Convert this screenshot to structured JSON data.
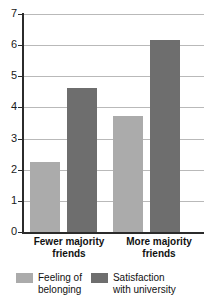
{
  "chart_data": {
    "type": "bar",
    "title": "",
    "subtitle": "",
    "xlabel": "",
    "ylabel": "",
    "ylim": [
      0,
      7
    ],
    "yticks": [
      0,
      1,
      2,
      3,
      4,
      5,
      6,
      7
    ],
    "ytick_labels": [
      "0",
      "1",
      "2",
      "3",
      "4",
      "5",
      "6",
      "7"
    ],
    "grid": true,
    "legend_position": "bottom",
    "categories": [
      "Fewer majority\nfriends",
      "More majority\nfriends"
    ],
    "category_labels_flat": [
      "Fewer majority friends",
      "More majority friends"
    ],
    "series": [
      {
        "name": "Feeling of\nbelonging",
        "name_flat": "Feeling of belonging",
        "color": "#ababab",
        "values": [
          2.25,
          3.73
        ]
      },
      {
        "name": "Satisfaction\nwith university",
        "name_flat": "Satisfaction with university",
        "color": "#6e6e6e",
        "values": [
          4.62,
          6.18
        ]
      }
    ]
  },
  "colors": {
    "series_light": "#ababab",
    "series_dark": "#6e6e6e",
    "axis": "#2b2b2b",
    "gridline": "#b9b9b9",
    "text": "#111111",
    "background": "#ffffff"
  }
}
